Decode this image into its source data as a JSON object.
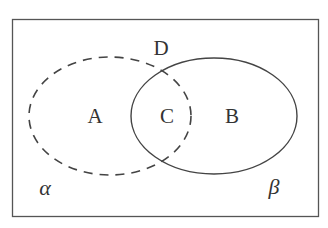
{
  "diagram": {
    "type": "venn",
    "frame": {
      "x": 12,
      "y": 19,
      "width": 307,
      "height": 198,
      "stroke": "#555555"
    },
    "sets": [
      {
        "id": "dashed-set",
        "style": "dashed",
        "cx": 110,
        "cy": 116,
        "rx": 81,
        "ry": 59,
        "stroke": "#444444"
      },
      {
        "id": "solid-set",
        "style": "solid",
        "cx": 214,
        "cy": 116,
        "rx": 83,
        "ry": 58,
        "stroke": "#444444"
      }
    ],
    "labels": {
      "A": "A",
      "B": "B",
      "C": "C",
      "D": "D",
      "alpha": "α",
      "beta": "β"
    }
  }
}
